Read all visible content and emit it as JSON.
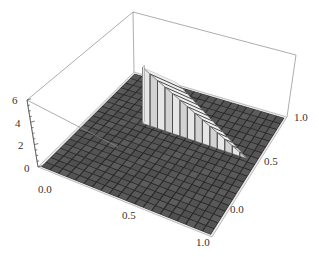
{
  "chart_data": {
    "type": "3d-surface",
    "title": "",
    "x_axis": {
      "label": "",
      "range": [
        0.0,
        1.0
      ],
      "ticks": [
        "0.0",
        "0.5",
        "1.0"
      ]
    },
    "y_axis": {
      "label": "",
      "range": [
        0.0,
        1.0
      ],
      "ticks": [
        "0.0",
        "0.5",
        "1.0"
      ]
    },
    "z_axis": {
      "label": "",
      "range": [
        0,
        6
      ],
      "ticks": [
        "0",
        "2",
        "4",
        "6"
      ]
    },
    "surface": {
      "base_value": 0,
      "raised_region": "triangle",
      "raised_value": 5,
      "mesh_cells": 20
    },
    "colors": {
      "floor": "#5a5a5a",
      "floor_grid": "#262626",
      "wall_light": "#f0f0f0",
      "wall_shade": "#bdbdbd",
      "box": "#888888"
    },
    "box": true,
    "grid": true,
    "legend": null
  },
  "labels": {
    "z_ticks": [
      "0",
      "2",
      "4",
      "6"
    ],
    "x_ticks": [
      "0.0",
      "0.5",
      "1.0"
    ],
    "y_ticks": [
      "0.0",
      "0.5",
      "1.0"
    ]
  }
}
